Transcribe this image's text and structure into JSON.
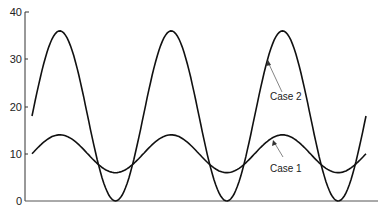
{
  "chart_data": {
    "type": "line",
    "title": "",
    "xlabel": "",
    "ylabel": "",
    "ylim": [
      0,
      40
    ],
    "yticks": [
      0,
      10,
      20,
      30,
      40
    ],
    "ytick_labels": [
      "0",
      "10",
      "20",
      "30",
      "40"
    ],
    "xticks": [],
    "grid": false,
    "legend": "none",
    "x": [
      0,
      0.5,
      1,
      1.5,
      2,
      2.5,
      3,
      3.5,
      4,
      4.5,
      5,
      5.5,
      6
    ],
    "series": [
      {
        "name": "Case 1",
        "description": "sinusoid, mean ~10, amplitude ~4",
        "values": [
          10,
          14,
          10,
          6.5,
          10,
          14,
          10,
          6.5,
          10,
          14,
          10,
          6.5,
          10
        ]
      },
      {
        "name": "Case 2",
        "description": "sinusoid, mean ~18, amplitude ~18",
        "values": [
          18,
          36,
          18,
          0,
          18,
          36,
          18,
          0,
          18,
          36,
          18,
          0,
          18
        ]
      }
    ],
    "annotations": [
      {
        "text": "Case 2",
        "points_to": "Case 2 curve near third peak"
      },
      {
        "text": "Case 1",
        "points_to": "Case 1 curve near third peak"
      }
    ]
  },
  "labels": {
    "y": [
      "0",
      "10",
      "20",
      "30",
      "40"
    ],
    "case1": "Case 1",
    "case2": "Case 2"
  }
}
